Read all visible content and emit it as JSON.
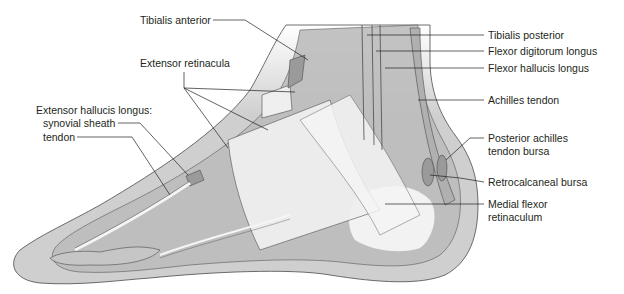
{
  "figure": {
    "labels": {
      "tibialis_anterior": "Tibialis anterior",
      "extensor_retinacula": "Extensor retinacula",
      "ehl_heading": "Extensor hallucis longus:",
      "ehl_synovial_sheath": "synovial sheath",
      "ehl_tendon": "tendon",
      "tibialis_posterior": "Tibialis posterior",
      "flexor_digitorum_longus": "Flexor digitorum longus",
      "flexor_hallucis_longus": "Flexor hallucis longus",
      "achilles_tendon": "Achilles tendon",
      "posterior_achilles_line1": "Posterior achilles",
      "posterior_achilles_line2": "tendon bursa",
      "retrocalcaneal_bursa": "Retrocalcaneal bursa",
      "medial_flexor_line1": "Medial flexor",
      "medial_flexor_line2": "retinaculum"
    },
    "colors": {
      "skin": "#cfcfcf",
      "soft_tissue": "#bdbdbd",
      "tendon_dark": "#9a9a9a",
      "retinaculum": "#efefef",
      "outline": "#4a4a4a",
      "leader_line": "#231f20",
      "text": "#231f20"
    }
  }
}
